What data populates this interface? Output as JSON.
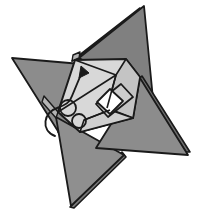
{
  "figure": {
    "caption": "",
    "width": 198,
    "height": 213,
    "background_color": "#ffffff",
    "stroke_color": "#1a1a1a",
    "colors": {
      "dark_gray": "#808080",
      "mid_gray": "#999999",
      "light_gray": "#d8d8d8",
      "pale_gray": "#c9c9c9",
      "white": "#ffffff",
      "outline": "#1a1a1a"
    },
    "shapes": {
      "point_top": {
        "label": "top-point",
        "fill": "#808080",
        "points": "144,6 153,99 79,58"
      },
      "point_top_under": {
        "label": "top-point-underlayer",
        "fill": "#7a7a7a",
        "points": "140,8 77,57 72,61 138,14"
      },
      "point_left": {
        "label": "left-point",
        "fill": "#8c8c8c",
        "points": "12,58 104,66 61,136"
      },
      "point_left_under": {
        "label": "left-point-underlayer",
        "fill": "#7a7a7a",
        "points": "58,132 104,66 108,70 62,138"
      },
      "point_right": {
        "label": "right-point",
        "fill": "#8c8c8c",
        "points": "188,155 96,148 140,78"
      },
      "point_right_under": {
        "label": "right-point-underlayer",
        "fill": "#6f6f6f",
        "points": "142,76 138,80 186,152 190,152"
      },
      "point_bottom": {
        "label": "bottom-point",
        "fill": "#8f8f8f",
        "points": "56,117 124,155 71,206"
      },
      "point_bottom_under": {
        "label": "bottom-point-underlayer",
        "fill": "#7a7a7a",
        "points": "122,152 126,157 74,208 70,207"
      },
      "body_main": {
        "label": "central-body-panel",
        "fill": "#d8d8d8",
        "points": "75,60 126,59 140,77 133,118 80,132 58,112"
      },
      "body_right_facet": {
        "label": "body-right-facet",
        "fill": "#c4c4c4",
        "points": "126,59 140,77 133,118 107,108 116,75"
      },
      "body_lower_facet": {
        "label": "body-lower-facet",
        "fill": "#cfcfcf",
        "points": "80,132 133,118 110,110 84,120"
      },
      "inner_band": {
        "label": "inner-diagonal-band",
        "fill": "#cccccc",
        "points": "96,104 121,84 133,97 108,117"
      },
      "inner_diamond": {
        "label": "inner-white-diamond",
        "fill": "#ffffff",
        "points": "97,102 110,89 123,101 110,114"
      },
      "tab_left": {
        "label": "left-edge-tab",
        "fill": "#b4b4b4",
        "points": "44,96 58,112 56,118 42,102"
      },
      "tab_top": {
        "label": "top-edge-tab",
        "fill": "#b4b4b4",
        "points": "72,61 79,58 80,52 73,55"
      }
    },
    "lines": [
      {
        "label": "body-crease-upper-right",
        "d": "M 75,60 L 116,75"
      },
      {
        "label": "body-crease-diagonal",
        "d": "M 58,112 L 116,75"
      },
      {
        "label": "body-crease-right-fold",
        "d": "M 116,75 L 107,108"
      },
      {
        "label": "body-crease-lower",
        "d": "M 84,120 L 110,110"
      },
      {
        "label": "body-crease-band-top",
        "d": "M 96,104 L 121,84"
      },
      {
        "label": "body-crease-band-bottom",
        "d": "M 108,117 L 133,97"
      }
    ],
    "annotations": {
      "arrow": {
        "label": "fold-direction-arrow",
        "type": "curved-arrow",
        "description": "curved arrow looping from lower-left up to upper-right indicating fold direction",
        "path": "M 55,136 C 40,130 44,112 57,108 C 66,105 70,102 72,96 L 82,72",
        "head": "78,68 86,70 82,80",
        "head_points": "81,66 89,73 79,78"
      },
      "circle_upper": {
        "label": "rotation-marker-circle-upper",
        "cx": 68,
        "cy": 108,
        "r": 8
      },
      "circle_lower": {
        "label": "rotation-marker-circle-lower",
        "cx": 79,
        "cy": 121,
        "r": 7
      }
    }
  }
}
